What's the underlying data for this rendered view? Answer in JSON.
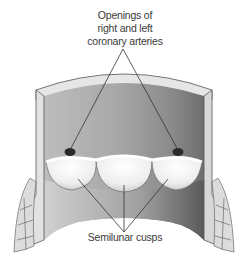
{
  "figure": {
    "labels": {
      "top": [
        "Openings of",
        "right and left",
        "coronary arteries"
      ],
      "bottom": "Semilunar cusps"
    },
    "colors": {
      "wall_outer": "#e8e8e8",
      "lumen_light": "#c8c8c8",
      "lumen_dark": "#6a6a6a",
      "cusp": "#f2f2f2",
      "opening": "#2a2a2a",
      "leader_line": "#333333",
      "text": "#3a3a3a"
    }
  }
}
